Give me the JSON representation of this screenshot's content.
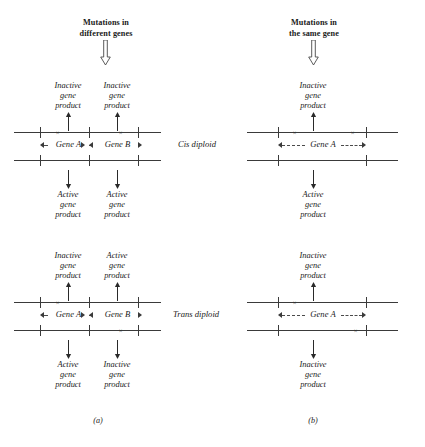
{
  "figure": {
    "panels": [
      {
        "id": "a",
        "caption": "(a)",
        "title_line1": "Mutations in",
        "title_line2": "different genes",
        "arrow_icon": "block-arrow-down-icon",
        "genes": [
          {
            "name": "Gene A"
          },
          {
            "name": "Gene B"
          }
        ],
        "rows": [
          {
            "config_label": "Cis diploid",
            "top_products": [
              {
                "line1": "Inactive",
                "line2": "gene",
                "line3": "product"
              },
              {
                "line1": "Inactive",
                "line2": "gene",
                "line3": "product"
              }
            ],
            "bottom_products": [
              {
                "line1": "Active",
                "line2": "gene",
                "line3": "product"
              },
              {
                "line1": "Active",
                "line2": "gene",
                "line3": "product"
              }
            ],
            "top_chromosome_mutations": [
              "gene-a",
              "gene-b"
            ],
            "bottom_chromosome_mutations": []
          },
          {
            "config_label": "Trans diploid",
            "top_products": [
              {
                "line1": "Inactive",
                "line2": "gene",
                "line3": "product"
              },
              {
                "line1": "Active",
                "line2": "gene",
                "line3": "product"
              }
            ],
            "bottom_products": [
              {
                "line1": "Active",
                "line2": "gene",
                "line3": "product"
              },
              {
                "line1": "Inactive",
                "line2": "gene",
                "line3": "product"
              }
            ],
            "top_chromosome_mutations": [
              "gene-a"
            ],
            "bottom_chromosome_mutations": [
              "gene-b"
            ]
          }
        ]
      },
      {
        "id": "b",
        "caption": "(b)",
        "title_line1": "Mutations in",
        "title_line2": "the same gene",
        "arrow_icon": "block-arrow-down-icon",
        "genes": [
          {
            "name": "Gene A"
          }
        ],
        "rows": [
          {
            "config_label": "Cis diploid",
            "top_products": [
              {
                "line1": "Inactive",
                "line2": "gene",
                "line3": "product"
              }
            ],
            "bottom_products": [
              {
                "line1": "Active",
                "line2": "gene",
                "line3": "product"
              }
            ],
            "top_chromosome_mutations": [
              "left",
              "right"
            ],
            "bottom_chromosome_mutations": []
          },
          {
            "config_label": "Trans diploid",
            "top_products": [
              {
                "line1": "Inactive",
                "line2": "gene",
                "line3": "product"
              }
            ],
            "bottom_products": [
              {
                "line1": "Inactive",
                "line2": "gene",
                "line3": "product"
              }
            ],
            "top_chromosome_mutations": [
              "left"
            ],
            "bottom_chromosome_mutations": [
              "right"
            ]
          }
        ]
      }
    ],
    "mutation_marker": "×",
    "colors": {
      "ink": "#1a1a1a",
      "line": "#3a3a3a",
      "background": "#ffffff"
    }
  }
}
